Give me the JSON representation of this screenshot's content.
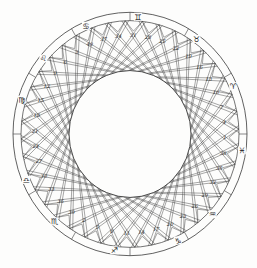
{
  "diagram": {
    "center": [
      130,
      134
    ],
    "radii": {
      "outer_band_outer": 117,
      "outer_band_inner": 109,
      "cells_inner_envelope": 61
    },
    "line_color": "#3a3a3a",
    "paper_color": "#fdfdfc",
    "cell_count": 40,
    "first_cell_angle_deg": -25,
    "cell_step_deg": 9,
    "cell_numbers_clockwise": [
      40,
      37,
      34,
      31,
      28,
      25,
      22,
      19,
      16,
      13,
      10,
      7,
      4,
      1,
      38,
      35,
      32,
      29,
      26,
      23,
      20,
      17,
      14,
      11,
      8,
      5,
      2,
      39,
      36,
      33,
      30,
      27,
      24,
      21,
      18,
      15,
      12,
      9,
      6,
      3
    ],
    "zodiac_signs": [
      {
        "name": "gemini",
        "glyph": "♊",
        "angle_deg": 4
      },
      {
        "name": "taurus",
        "glyph": "♉",
        "angle_deg": 36
      },
      {
        "name": "aries",
        "glyph": "♈",
        "angle_deg": 66
      },
      {
        "name": "pisces",
        "glyph": "♓",
        "angle_deg": 98
      },
      {
        "name": "aquarius",
        "glyph": "♒",
        "angle_deg": 133
      },
      {
        "name": "capricorn",
        "glyph": "♑",
        "angle_deg": 155
      },
      {
        "name": "sagittarius",
        "glyph": "♐",
        "angle_deg": 188
      },
      {
        "name": "scorpio",
        "glyph": "♏",
        "angle_deg": 222
      },
      {
        "name": "libra",
        "glyph": "♎",
        "angle_deg": 247
      },
      {
        "name": "virgo",
        "glyph": "♍",
        "angle_deg": 287
      },
      {
        "name": "leo",
        "glyph": "♌",
        "angle_deg": 310
      },
      {
        "name": "cancer",
        "glyph": "♋",
        "angle_deg": 337
      }
    ],
    "band_tick_angles_deg": [
      0,
      30,
      60,
      90,
      120,
      150,
      180,
      210,
      240,
      270,
      300,
      330
    ]
  }
}
